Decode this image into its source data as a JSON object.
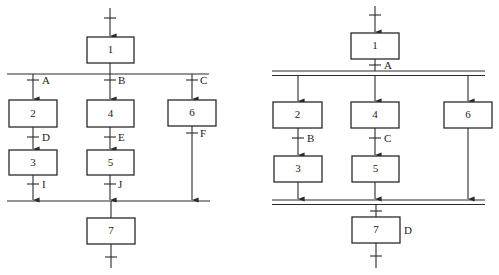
{
  "diagrams": [
    {
      "name": "selective-divergence",
      "description": "SFC with single-line OR divergence/convergence",
      "steps": [
        "1",
        "2",
        "3",
        "4",
        "5",
        "6",
        "7"
      ],
      "transitions": [
        "A",
        "B",
        "C",
        "D",
        "E",
        "F",
        "I",
        "J"
      ]
    },
    {
      "name": "simultaneous-divergence",
      "description": "SFC with double-line AND divergence/convergence",
      "steps": [
        "1",
        "2",
        "3",
        "4",
        "5",
        "6",
        "7"
      ],
      "transitions": [
        "A",
        "B",
        "C"
      ],
      "step_actions": {
        "7": "D"
      }
    }
  ],
  "left": {
    "steps": {
      "s1": "1",
      "s2": "2",
      "s3": "3",
      "s4": "4",
      "s5": "5",
      "s6": "6",
      "s7": "7"
    },
    "transitions": {
      "a": "A",
      "b": "B",
      "c": "C",
      "d": "D",
      "e": "E",
      "f": "F",
      "i": "I",
      "j": "J"
    }
  },
  "right": {
    "steps": {
      "s1": "1",
      "s2": "2",
      "s3": "3",
      "s4": "4",
      "s5": "5",
      "s6": "6",
      "s7": "7"
    },
    "transitions": {
      "a": "A",
      "b": "B",
      "c": "C"
    },
    "action_label": "D"
  }
}
